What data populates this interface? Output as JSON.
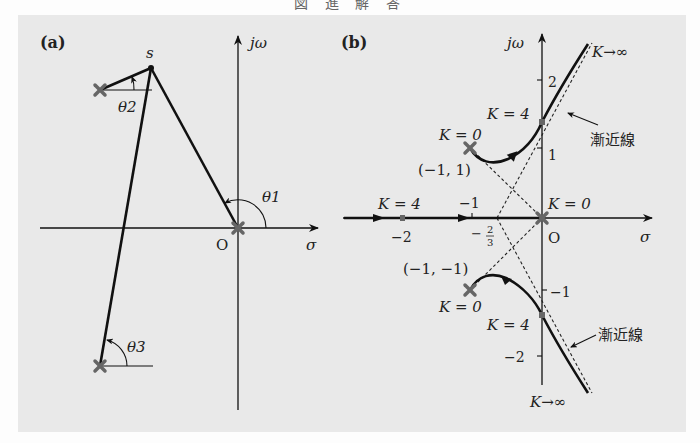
{
  "header": {
    "text": "図 進 解 答"
  },
  "panel_a": {
    "label": "(a)",
    "axis_imag": "jω",
    "axis_real": "σ",
    "origin": "O",
    "point": "s",
    "angles": {
      "theta1": "θ1",
      "theta2": "θ2",
      "theta3": "θ3"
    },
    "poles": [
      {
        "x": 100,
        "y": 90
      },
      {
        "x": 238,
        "y": 228
      },
      {
        "x": 100,
        "y": 366
      }
    ]
  },
  "panel_b": {
    "label": "(b)",
    "axis_imag": "jω",
    "axis_real": "σ",
    "origin": "O",
    "ticks_imag": [
      "2",
      "1",
      "−1",
      "−2"
    ],
    "ticks_real": [
      "−2",
      "−1"
    ],
    "centroid_num": "2",
    "centroid_den": "3",
    "centroid_sign": "−",
    "labels": {
      "k_inf_top": "K→∞",
      "k_inf_bottom": "K→∞",
      "k4_top": "K = 4",
      "k4_bottom": "K = 4",
      "k4_real": "K = 4",
      "k0_top": "K = 0",
      "k0_bottom": "K = 0",
      "k0_origin": "K = 0",
      "pole_top": "(−1, 1)",
      "pole_bottom": "(−1, −1)",
      "asymptote_top": "漸近線",
      "asymptote_bottom": "漸近線"
    }
  },
  "colors": {
    "background": "#e9e9e9",
    "line": "#111111",
    "pole": "#666666",
    "text": "#222222"
  }
}
